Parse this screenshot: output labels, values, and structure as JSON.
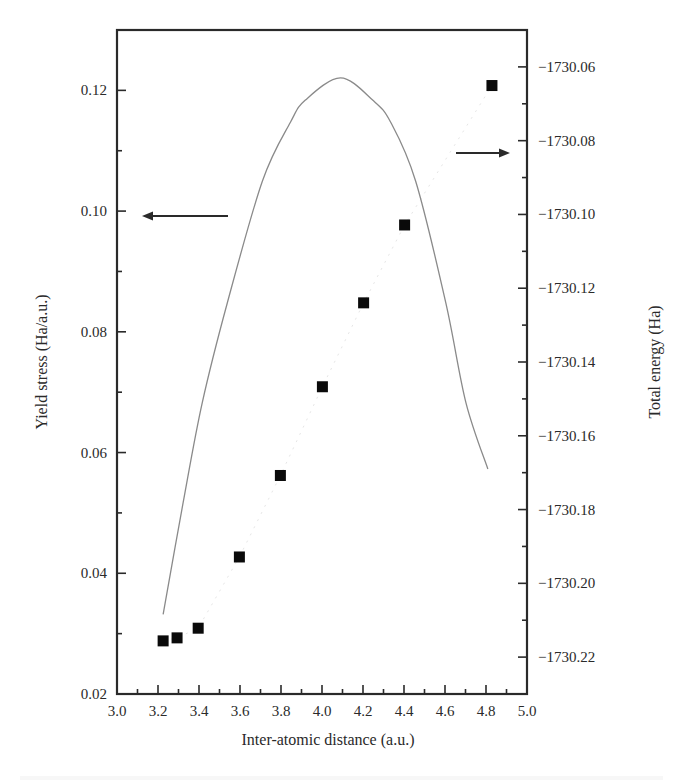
{
  "chart_data": {
    "type": "scatter",
    "title": "",
    "xlabel": "Inter-atomic distance (a.u.)",
    "ylabel_left": "Yield stress (Ha/a.u.)",
    "ylabel_right": "Total energy (Ha)",
    "xlim": [
      3.0,
      5.0
    ],
    "ylim_left": [
      0.02,
      0.13
    ],
    "ylim_right": [
      -1730.23,
      -1730.05
    ],
    "x_ticks": [
      "3.0",
      "3.2",
      "3.4",
      "3.6",
      "3.8",
      "4.0",
      "4.2",
      "4.4",
      "4.6",
      "4.8",
      "5.0"
    ],
    "x_tick_values": [
      3.0,
      3.2,
      3.4,
      3.6,
      3.8,
      4.0,
      4.2,
      4.4,
      4.6,
      4.8,
      5.0
    ],
    "y_left_ticks": [
      "0.02",
      "0.04",
      "0.06",
      "0.08",
      "0.10",
      "0.12"
    ],
    "y_left_tick_values": [
      0.02,
      0.04,
      0.06,
      0.08,
      0.1,
      0.12
    ],
    "y_right_ticks": [
      "−1730.06",
      "−1730.08",
      "−1730.10",
      "−1730.12",
      "−1730.14",
      "−1730.16",
      "−1730.18",
      "−1730.20",
      "−1730.22"
    ],
    "y_right_tick_values": [
      -1730.06,
      -1730.08,
      -1730.1,
      -1730.12,
      -1730.14,
      -1730.16,
      -1730.18,
      -1730.2,
      -1730.22
    ],
    "grid": false,
    "series": [
      {
        "name": "Yield stress",
        "axis": "left",
        "style": "square-markers",
        "x": [
          3.225,
          3.293,
          3.396,
          3.597,
          3.797,
          4.002,
          4.203,
          4.403,
          4.829
        ],
        "y": [
          0.0288,
          0.0293,
          0.0309,
          0.0427,
          0.0562,
          0.0709,
          0.0848,
          0.0977,
          0.1208
        ]
      },
      {
        "name": "Total energy",
        "axis": "right",
        "style": "line",
        "x": [
          3.225,
          3.323,
          3.416,
          3.538,
          3.709,
          3.846,
          3.919,
          4.09,
          4.247,
          4.335,
          4.457,
          4.604,
          4.702,
          4.809
        ],
        "y": [
          -1730.2084,
          -1730.178,
          -1730.151,
          -1730.124,
          -1730.091,
          -1730.075,
          -1730.069,
          -1730.063,
          -1730.069,
          -1730.075,
          -1730.091,
          -1730.124,
          -1730.151,
          -1730.169
        ]
      }
    ],
    "annotations": [
      {
        "type": "arrow",
        "direction": "left",
        "points_to_axis": "left",
        "meaning": "Yield stress series uses left axis"
      },
      {
        "type": "arrow",
        "direction": "right",
        "points_to_axis": "right",
        "meaning": "Total energy series uses right axis"
      }
    ]
  }
}
